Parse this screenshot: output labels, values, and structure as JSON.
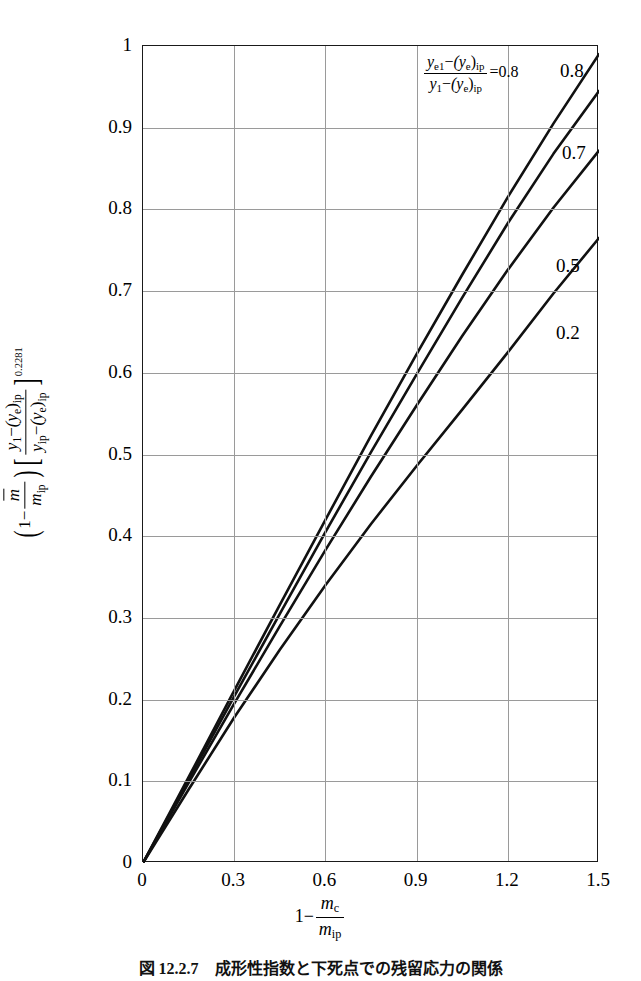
{
  "figure": {
    "caption": "図 12.2.7　成形性指数と下死点での残留応力の関係",
    "background": "#ffffff",
    "curve_color": "#111111",
    "grid_color": "#9a9a9a",
    "frame_color": "#1a1a1a"
  },
  "axes": {
    "x_ticks": [
      "0",
      "0.3",
      "0.6",
      "0.9",
      "1.2",
      "1.5"
    ],
    "x_tick_values": [
      0,
      0.3,
      0.6,
      0.9,
      1.2,
      1.5
    ],
    "y_ticks": [
      "0",
      "0.1",
      "0.2",
      "0.3",
      "0.4",
      "0.5",
      "0.6",
      "0.7",
      "0.8",
      "0.9",
      "1"
    ],
    "y_tick_values": [
      0,
      0.1,
      0.2,
      0.3,
      0.4,
      0.5,
      0.6,
      0.7,
      0.8,
      0.9,
      1.0
    ],
    "x_title_parts": {
      "lead": "1",
      "minus": "−",
      "num": "m",
      "num_sub": "c",
      "den": "m",
      "den_sub": "ip"
    },
    "y_title_parts": {
      "lead": "1",
      "minus": "−",
      "mbar_num": "m",
      "mbar_den": "m",
      "mbar_den_sub": "ip",
      "bracket_num_a": "y",
      "bracket_num_a_sub": "1",
      "bracket_num_b": "(y",
      "bracket_num_b_sub": "e",
      "bracket_num_b_tail": ")",
      "bracket_num_b_sub2": "ip",
      "bracket_den_a": "y",
      "bracket_den_a_sub": "ip",
      "bracket_den_b": "(y",
      "bracket_den_b_sub": "e",
      "bracket_den_b_tail": ")",
      "bracket_den_b_sub2": "ip",
      "exponent": "0.2281"
    }
  },
  "annotation": {
    "num_a": "y",
    "num_a_sub": "e1",
    "num_b": "(y",
    "num_b_sub": "e",
    "num_b_tail": ")",
    "num_b_sub2": "ip",
    "den_a": "y",
    "den_a_sub": "1",
    "den_b": "(y",
    "den_b_sub": "e",
    "den_b_tail": ")",
    "den_b_sub2": "ip",
    "equals_value": "=0.8"
  },
  "curve_labels": [
    {
      "text": "0.8",
      "x": 560,
      "y": 60
    },
    {
      "text": "0.7",
      "x": 562,
      "y": 142
    },
    {
      "text": "0.5",
      "x": 556,
      "y": 255
    },
    {
      "text": "0.2",
      "x": 556,
      "y": 322
    }
  ],
  "chart_data": {
    "type": "line",
    "title": "",
    "xlabel": "1 - m_c/m_ip",
    "ylabel": "(1 - mbar/m_ip)[(y_1-(y_e)_ip)/(y_ip-(y_e)_ip)]^0.2281",
    "xlim": [
      0,
      1.5
    ],
    "ylim": [
      0,
      1
    ],
    "xticks": [
      0,
      0.3,
      0.6,
      0.9,
      1.2,
      1.5
    ],
    "yticks": [
      0,
      0.1,
      0.2,
      0.3,
      0.4,
      0.5,
      0.6,
      0.7,
      0.8,
      0.9,
      1.0
    ],
    "grid": true,
    "legend": "inline-curve-labels",
    "legend_title": "y_e1-(y_e)_ip / y_1-(y_e)_ip",
    "x": [
      0,
      0.15,
      0.3,
      0.45,
      0.6,
      0.75,
      0.9,
      1.05,
      1.2,
      1.35,
      1.5
    ],
    "series": [
      {
        "name": "0.8",
        "label": "0.8",
        "values": [
          0,
          0.105,
          0.211,
          0.316,
          0.42,
          0.523,
          0.623,
          0.72,
          0.815,
          0.905,
          0.99
        ]
      },
      {
        "name": "0.7",
        "label": "0.7",
        "values": [
          0,
          0.102,
          0.204,
          0.305,
          0.405,
          0.503,
          0.598,
          0.692,
          0.783,
          0.868,
          0.945
        ]
      },
      {
        "name": "0.5",
        "label": "0.5",
        "values": [
          0,
          0.098,
          0.195,
          0.29,
          0.383,
          0.473,
          0.56,
          0.645,
          0.726,
          0.802,
          0.872
        ]
      },
      {
        "name": "0.2",
        "label": "0.2",
        "values": [
          0,
          0.09,
          0.178,
          0.261,
          0.34,
          0.415,
          0.486,
          0.555,
          0.625,
          0.697,
          0.765
        ]
      }
    ]
  }
}
